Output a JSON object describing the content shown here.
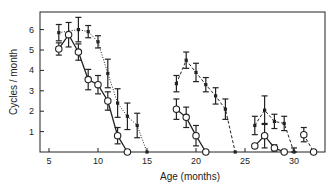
{
  "chart_data": {
    "type": "line",
    "title": "",
    "xlabel": "Age (months)",
    "ylabel": "Cycles / month",
    "xlim": [
      3,
      33
    ],
    "ylim": [
      0,
      6.8
    ],
    "xticks": [
      5,
      10,
      15,
      20,
      25,
      30
    ],
    "yticks": [
      1,
      2,
      3,
      4,
      5,
      6
    ],
    "grid": false,
    "legend": null,
    "series": [
      {
        "name": "filled-dotted-group1",
        "marker": "filled",
        "line": "dotted",
        "points": [
          {
            "x": 6,
            "y": 5.85,
            "err": 0.4
          },
          {
            "x": 8,
            "y": 6.0,
            "err": 0.6
          },
          {
            "x": 9,
            "y": 5.9,
            "err": 0.3
          },
          {
            "x": 10,
            "y": 5.4,
            "err": 0.3
          },
          {
            "x": 11,
            "y": 3.85,
            "err": 0.7
          },
          {
            "x": 12,
            "y": 2.4,
            "err": 0.7
          },
          {
            "x": 13,
            "y": 1.75,
            "err": 0.65
          },
          {
            "x": 14,
            "y": 1.3,
            "err": 0.6
          },
          {
            "x": 15,
            "y": 0.0,
            "err": 0
          }
        ]
      },
      {
        "name": "open-solid-group1",
        "marker": "open",
        "line": "solid",
        "points": [
          {
            "x": 6,
            "y": 5.05,
            "err": 0.3
          },
          {
            "x": 7,
            "y": 5.75,
            "err": 0.6
          },
          {
            "x": 8,
            "y": 4.9,
            "err": 0.4
          },
          {
            "x": 9,
            "y": 3.55,
            "err": 0.5
          },
          {
            "x": 10,
            "y": 3.3,
            "err": 0.45
          },
          {
            "x": 11,
            "y": 2.5,
            "err": 0.45
          },
          {
            "x": 12,
            "y": 0.8,
            "err": 0.4
          },
          {
            "x": 13,
            "y": 0.0,
            "err": 0
          }
        ]
      },
      {
        "name": "filled-dashed-group2",
        "marker": "filled",
        "line": "dashed",
        "points": [
          {
            "x": 18,
            "y": 3.35,
            "err": 0.4
          },
          {
            "x": 19,
            "y": 4.5,
            "err": 0.4
          },
          {
            "x": 20,
            "y": 3.9,
            "err": 0.45
          },
          {
            "x": 21,
            "y": 3.3,
            "err": 0.35
          },
          {
            "x": 22,
            "y": 2.75,
            "err": 0.4
          },
          {
            "x": 23,
            "y": 2.1,
            "err": 0.5
          },
          {
            "x": 24,
            "y": 0.0,
            "err": 0
          }
        ]
      },
      {
        "name": "open-solid-group2",
        "marker": "open",
        "line": "solid",
        "points": [
          {
            "x": 18,
            "y": 2.1,
            "err": 0.5
          },
          {
            "x": 19,
            "y": 1.7,
            "err": 0.5
          },
          {
            "x": 20,
            "y": 0.8,
            "err": 0.5
          },
          {
            "x": 21,
            "y": 0.0,
            "err": 0
          }
        ]
      },
      {
        "name": "filled-dashed-group3",
        "marker": "filled",
        "line": "dashed",
        "points": [
          {
            "x": 26,
            "y": 1.3,
            "err": 0.45
          },
          {
            "x": 27,
            "y": 2.05,
            "err": 0.7
          },
          {
            "x": 28,
            "y": 1.5,
            "err": 0.35
          },
          {
            "x": 29,
            "y": 1.4,
            "err": 0.35
          },
          {
            "x": 30,
            "y": 0.0,
            "err": 0.2
          }
        ]
      },
      {
        "name": "open-solid-group3",
        "marker": "open",
        "line": "solid",
        "points": [
          {
            "x": 26,
            "y": 0.3,
            "err": 0
          },
          {
            "x": 27,
            "y": 0.8,
            "err": 0.6
          },
          {
            "x": 28,
            "y": 0.2,
            "err": 0.15
          },
          {
            "x": 29,
            "y": 0.0,
            "err": 0
          }
        ]
      },
      {
        "name": "open-dashed-group3b",
        "marker": "open",
        "line": "dashed",
        "points": [
          {
            "x": 31,
            "y": 0.85,
            "err": 0.35
          },
          {
            "x": 32,
            "y": 0.0,
            "err": 0
          }
        ]
      }
    ]
  },
  "axes": {
    "x_label": "Age (months)",
    "y_label": "Cycles / month"
  }
}
